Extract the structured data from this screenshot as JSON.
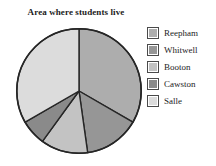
{
  "chart_data": {
    "type": "pie",
    "title": "Area where students live",
    "xlabel": "",
    "ylabel": "",
    "legend_position": "right",
    "grid": false,
    "categories": [
      "Reepham",
      "Whitwell",
      "Booton",
      "Cawston",
      "Salle"
    ],
    "values": [
      33.3,
      14.4,
      12.2,
      6.7,
      33.4
    ],
    "angles_deg": [
      120,
      52,
      44,
      24,
      120
    ],
    "colors": [
      "#adadad",
      "#969696",
      "#c3c3c3",
      "#8a8a8a",
      "#dcdcdc"
    ],
    "start_angle_deg": 0,
    "direction": "clockwise",
    "slices": [
      {
        "label": "Reepham",
        "value": 33.3,
        "angle_deg": 120,
        "color": "#adadad"
      },
      {
        "label": "Whitwell",
        "value": 14.4,
        "angle_deg": 52,
        "color": "#969696"
      },
      {
        "label": "Booton",
        "value": 12.2,
        "angle_deg": 44,
        "color": "#c3c3c3"
      },
      {
        "label": "Cawston",
        "value": 6.7,
        "angle_deg": 24,
        "color": "#8a8a8a"
      },
      {
        "label": "Salle",
        "value": 33.4,
        "angle_deg": 120,
        "color": "#dcdcdc"
      }
    ]
  },
  "legend": {
    "items": [
      {
        "label": "Reepham",
        "color": "#adadad"
      },
      {
        "label": "Whitwell",
        "color": "#969696"
      },
      {
        "label": "Booton",
        "color": "#c3c3c3"
      },
      {
        "label": "Cawston",
        "color": "#8a8a8a"
      },
      {
        "label": "Salle",
        "color": "#dcdcdc"
      }
    ]
  },
  "style": {
    "outline_color": "#262626",
    "background": "#ffffff",
    "title_color": "#1b1b1b"
  }
}
